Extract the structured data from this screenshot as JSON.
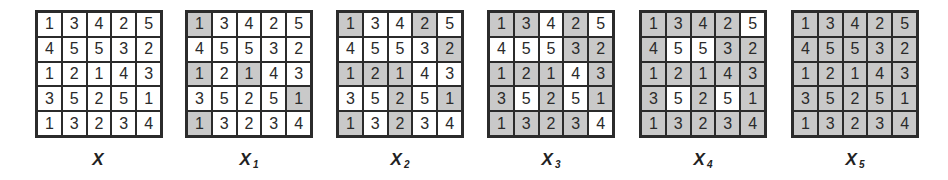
{
  "matrix": [
    [
      1,
      3,
      4,
      2,
      5
    ],
    [
      4,
      5,
      5,
      3,
      2
    ],
    [
      1,
      2,
      1,
      4,
      3
    ],
    [
      3,
      5,
      2,
      5,
      1
    ],
    [
      1,
      3,
      2,
      3,
      4
    ]
  ],
  "shading": {
    "shaded_color": "#c9c9c9",
    "unshaded_color": "#ffffff"
  },
  "panels": [
    {
      "label": "X",
      "subscript": "",
      "threshold": 0
    },
    {
      "label": "X",
      "subscript": "1",
      "threshold": 1
    },
    {
      "label": "X",
      "subscript": "2",
      "threshold": 2
    },
    {
      "label": "X",
      "subscript": "3",
      "threshold": 3
    },
    {
      "label": "X",
      "subscript": "4",
      "threshold": 4
    },
    {
      "label": "X",
      "subscript": "5",
      "threshold": 5
    }
  ],
  "rule": "cells with value <= subscript threshold are shaded"
}
